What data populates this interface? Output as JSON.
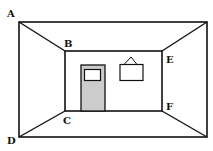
{
  "diagram": {
    "type": "room-perspective",
    "labels": {
      "A": "A",
      "B": "B",
      "C": "C",
      "D": "D",
      "E": "E",
      "F": "F"
    },
    "colors": {
      "stroke": "#111111",
      "door_fill": "#cccccc",
      "background": "#ffffff"
    },
    "objects": [
      "door",
      "door-window",
      "picture-frame",
      "picture-hanger"
    ]
  }
}
